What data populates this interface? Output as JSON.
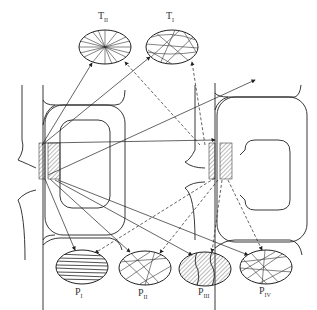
{
  "diagram": {
    "top_patterns": [
      {
        "id": "T_II",
        "label": "T",
        "subscript": "II",
        "pattern": "radial"
      },
      {
        "id": "T_I",
        "label": "T",
        "subscript": "I",
        "pattern": "random-network"
      }
    ],
    "bottom_patterns": [
      {
        "id": "P_I",
        "label": "P",
        "subscript": "I",
        "pattern": "parallel"
      },
      {
        "id": "P_II",
        "label": "P",
        "subscript": "II",
        "pattern": "random-network"
      },
      {
        "id": "P_III",
        "label": "P",
        "subscript": "III",
        "pattern": "hatched-with-cracks"
      },
      {
        "id": "P_IV",
        "label": "P",
        "subscript": "IV",
        "pattern": "random-network"
      }
    ],
    "cells": [
      {
        "id": "left-cell",
        "arrows": "solid"
      },
      {
        "id": "right-cell",
        "arrows": "dashed"
      }
    ],
    "colors": {
      "line": "#222222",
      "background": "#ffffff"
    }
  }
}
